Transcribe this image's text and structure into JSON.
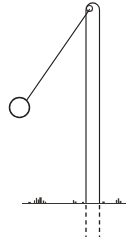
{
  "figure": {
    "type": "line-diagram",
    "background_color": "#ffffff",
    "ink_color": "#231f1e",
    "canvas": {
      "width": 126,
      "height": 243
    }
  },
  "chart_data": {
    "type": "diagram",
    "elements": [
      {
        "name": "post",
        "label": "vertical post",
        "shape": "rounded-top rectangle",
        "left_x": 86,
        "right_x": 99.5,
        "top_y": 3,
        "bottom_y": 204,
        "cap_radius": 6.7,
        "color": "#231f1e"
      },
      {
        "name": "pivot",
        "label": "pivot point",
        "shape": "circle",
        "cx": 89.5,
        "cy": 8.5,
        "r": 3.0,
        "color": "#2a2523"
      },
      {
        "name": "rod",
        "label": "pendulum string",
        "shape": "line",
        "x1": 89.5,
        "y1": 9.5,
        "x2": 26.5,
        "y2": 100.5,
        "color": "#231f1e"
      },
      {
        "name": "bob",
        "label": "pendulum bob",
        "shape": "circle",
        "cx": 19.5,
        "cy": 107.5,
        "r": 10.0,
        "color": "#231f1e"
      },
      {
        "name": "ground",
        "label": "ground line",
        "shape": "line",
        "x1": 22,
        "y1": 203.5,
        "x2": 126,
        "y2": 203.5,
        "color": "#3a3431"
      },
      {
        "name": "buried-post-left",
        "label": "buried post edge (dashed)",
        "shape": "dashed-line",
        "x1": 86,
        "y1": 205,
        "x2": 86,
        "y2": 237,
        "color": "#231f1e"
      },
      {
        "name": "buried-post-right",
        "label": "buried post edge (dashed)",
        "shape": "dashed-line",
        "x1": 99.5,
        "y1": 205,
        "x2": 99.5,
        "y2": 237,
        "color": "#231f1e"
      }
    ],
    "ground_texture_ticks": [
      {
        "x": 34.5,
        "h": 3.2,
        "w": 1.1
      },
      {
        "x": 36.5,
        "h": 5.6,
        "w": 1.2
      },
      {
        "x": 38.5,
        "h": 4.0,
        "w": 1.5
      },
      {
        "x": 40.5,
        "h": 6.2,
        "w": 2.4
      },
      {
        "x": 43.5,
        "h": 3.0,
        "w": 1.4
      },
      {
        "x": 45.5,
        "h": 1.8,
        "w": 1.2
      },
      {
        "x": 29.5,
        "h": 1.6,
        "w": 2.6
      },
      {
        "x": 73.5,
        "h": 3.4,
        "w": 1.2
      },
      {
        "x": 75.5,
        "h": 2.0,
        "w": 2.0
      },
      {
        "x": 83.0,
        "h": 1.6,
        "w": 2.0
      },
      {
        "x": 103.5,
        "h": 2.0,
        "w": 2.4
      },
      {
        "x": 116.5,
        "h": 3.6,
        "w": 1.3
      },
      {
        "x": 118.5,
        "h": 5.2,
        "w": 1.4
      },
      {
        "x": 120.5,
        "h": 2.6,
        "w": 1.8
      }
    ]
  }
}
